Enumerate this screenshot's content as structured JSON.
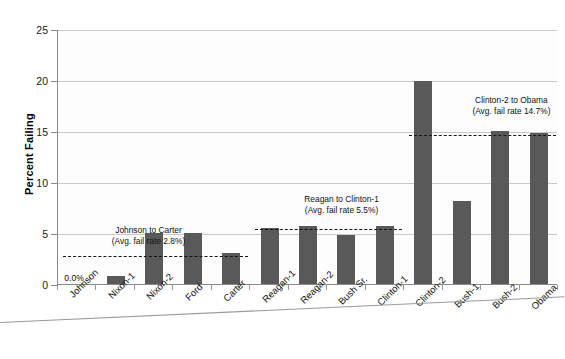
{
  "chart_data": {
    "type": "bar",
    "title": "",
    "xlabel": "",
    "ylabel": "Percent Failing",
    "ylim": [
      0,
      25
    ],
    "ytick_labels": [
      "0",
      "5",
      "10",
      "15",
      "20",
      "25"
    ],
    "ytick_values": [
      0,
      5,
      10,
      15,
      20,
      25
    ],
    "grid": "horizontal",
    "legend": "none",
    "bar_color": "#595959",
    "categories": [
      "Johnson",
      "Nixon-1",
      "Nixon-2",
      "Ford",
      "Carter",
      "Reagan-1",
      "Reagan-2",
      "Bush Sr.",
      "Clinton-1",
      "Clinton-2",
      "Bush-1",
      "Bush-2",
      "Obama"
    ],
    "values": [
      0.0,
      0.8,
      5.0,
      5.0,
      3.0,
      5.5,
      5.7,
      4.8,
      5.7,
      19.9,
      8.1,
      15.0,
      14.8
    ],
    "data_labels": [
      {
        "category": "Johnson",
        "text": "0.0%"
      }
    ],
    "annotations": [
      {
        "name": "johnson-to-carter",
        "line1": "Johnson to Carter",
        "line2": "(Avg. fail rate 2.8%)",
        "avg_value": 2.8,
        "span_categories": [
          "Johnson",
          "Carter"
        ]
      },
      {
        "name": "reagan-to-clinton1",
        "line1": "Reagan to Clinton-1",
        "line2": "(Avg. fail rate 5.5%)",
        "avg_value": 5.5,
        "span_categories": [
          "Reagan-1",
          "Clinton-1"
        ]
      },
      {
        "name": "clinton2-to-obama",
        "line1": "Clinton-2 to Obama",
        "line2": "(Avg. fail rate 14.7%)",
        "avg_value": 14.7,
        "span_categories": [
          "Clinton-2",
          "Obama"
        ]
      }
    ]
  }
}
